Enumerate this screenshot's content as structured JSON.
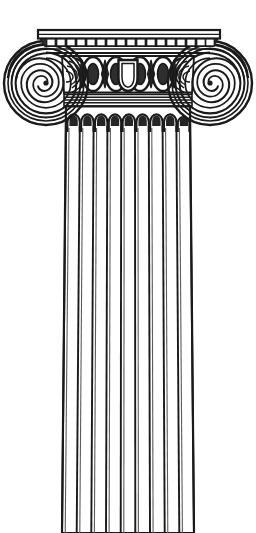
{
  "image": {
    "kind": "line-illustration",
    "subject": "ionic-column",
    "title": "Ionic Column Capital and Fluted Shaft",
    "width": 256,
    "height": 533,
    "background_color": "#ffffff",
    "ink_color": "#1a1a1a",
    "shade_color": "#4a4a4a",
    "style": "black and white engraving / line art",
    "orientation": "vertical"
  },
  "parts": {
    "abacus": {
      "name": "abacus",
      "label": "Abacus",
      "top_y": 30,
      "bottom_y": 44,
      "left_x": 38,
      "right_x": 220,
      "ornament": "dentil-arch-band",
      "dentil_count": 17
    },
    "echinus": {
      "name": "echinus",
      "label": "Echinus with egg-and-dart",
      "top_y": 55,
      "bottom_y": 95,
      "egg_count": 4,
      "central_motif": "shield-palmette",
      "ornament": "egg-and-dart"
    },
    "volute_left": {
      "name": "volute-left",
      "label": "Left Volute",
      "center_x": 46,
      "center_y": 83,
      "outer_radius": 42,
      "spiral_turns": 3.2,
      "direction": "clockwise"
    },
    "volute_right": {
      "name": "volute-right",
      "label": "Right Volute",
      "center_x": 210,
      "center_y": 83,
      "outer_radius": 42,
      "spiral_turns": 3.2,
      "direction": "counter-clockwise"
    },
    "balteus_left": {
      "name": "balteus-left",
      "label": "Left Baluster Strap",
      "x": 88,
      "y": 60
    },
    "balteus_right": {
      "name": "balteus-right",
      "label": "Right Baluster Strap",
      "x": 168,
      "y": 60
    },
    "astragal": {
      "name": "astragal",
      "label": "Astragal Bands",
      "top_y": 93,
      "bottom_y": 106,
      "left_x": 64,
      "right_x": 192,
      "band_count": 5
    },
    "shaft": {
      "name": "shaft",
      "label": "Fluted Shaft",
      "top_y": 106,
      "bottom_y": 533,
      "top_left_x": 66,
      "top_right_x": 190,
      "bottom_left_x": 62,
      "bottom_right_x": 194,
      "flute_count": 9,
      "flute_top_shape": "rounded-arch",
      "arris_count": 10,
      "truncated_at_bottom": true
    }
  },
  "flutes": [
    {
      "index": 1,
      "label": "flute-1"
    },
    {
      "index": 2,
      "label": "flute-2"
    },
    {
      "index": 3,
      "label": "flute-3"
    },
    {
      "index": 4,
      "label": "flute-4"
    },
    {
      "index": 5,
      "label": "flute-5"
    },
    {
      "index": 6,
      "label": "flute-6"
    },
    {
      "index": 7,
      "label": "flute-7"
    },
    {
      "index": 8,
      "label": "flute-8"
    },
    {
      "index": 9,
      "label": "flute-9"
    }
  ]
}
